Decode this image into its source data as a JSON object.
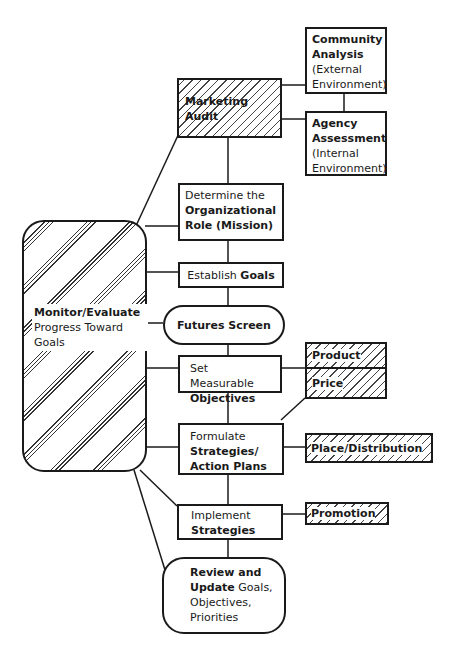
{
  "diagram": {
    "nodes": {
      "community_analysis": {
        "title": "Community Analysis",
        "subtitle": "(External Environment)"
      },
      "agency_assessment": {
        "title": "Agency Assessment",
        "subtitle": "(Internal Environment)"
      },
      "marketing_audit": {
        "title": "Marketing Audit"
      },
      "determine_role": {
        "prefix": "Determine the",
        "title": "Organizational Role (Mission)"
      },
      "establish_goals": {
        "prefix": "Establish",
        "title": "Goals"
      },
      "futures_screen": {
        "title": "Futures Screen"
      },
      "set_objectives": {
        "prefix": "Set Measurable",
        "title": "Objectives"
      },
      "formulate_strategies": {
        "prefix": "Formulate",
        "title": "Strategies/ Action Plans"
      },
      "implement_strategies": {
        "prefix": "Implement",
        "title": "Strategies"
      },
      "review_update": {
        "title": "Review and Update",
        "suffix": "Goals, Objectives, Priorities"
      },
      "monitor_evaluate": {
        "title": "Monitor/Evaluate",
        "suffix": "Progress Toward Goals"
      },
      "product": {
        "title": "Product"
      },
      "price": {
        "title": "Price"
      },
      "place_distribution": {
        "title": "Place/Distribution"
      },
      "promotion": {
        "title": "Promotion"
      }
    }
  }
}
